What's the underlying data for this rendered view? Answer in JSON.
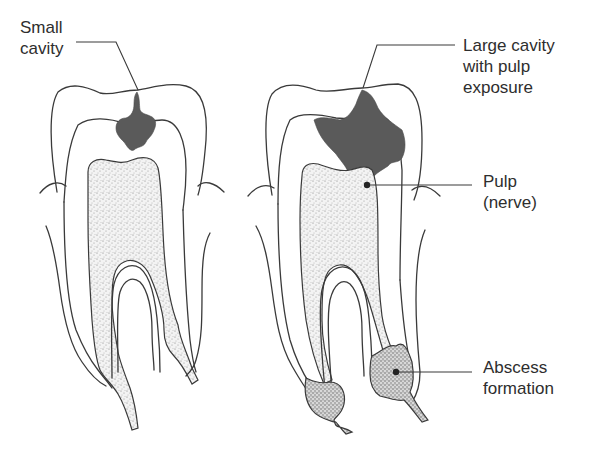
{
  "diagram": {
    "colors": {
      "outline": "#3a3a3a",
      "decay": "#5a5a5a",
      "text": "#2e2e2e",
      "background": "#ffffff"
    },
    "teeth": [
      {
        "id": "left",
        "state": "small cavity"
      },
      {
        "id": "right",
        "state": "large cavity with pulp exposure and abscess"
      }
    ],
    "labels": {
      "small_cavity": {
        "line1": "Small",
        "line2": "cavity"
      },
      "large_cavity": {
        "line1": "Large cavity",
        "line2": "with pulp",
        "line3": "exposure"
      },
      "pulp": {
        "line1": "Pulp",
        "line2": "(nerve)"
      },
      "abscess": {
        "line1": "Abscess",
        "line2": "formation"
      }
    }
  }
}
